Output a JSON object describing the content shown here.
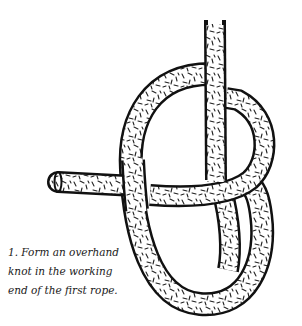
{
  "figure": {
    "step_number": "1.",
    "caption_lines": [
      "1. Form an overhand",
      "knot in the working",
      "end of the first rope."
    ],
    "colors": {
      "outline": "#111111",
      "rope_fill": "#ffffff",
      "texture": "#222222",
      "background": "#ffffff"
    }
  }
}
